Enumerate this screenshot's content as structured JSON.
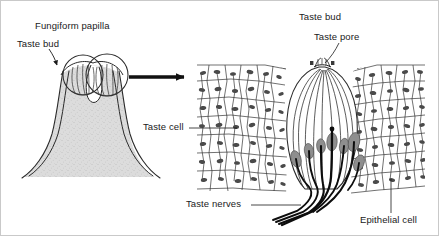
{
  "figure": {
    "title_alt": "Fungiform papilla and taste bud structure",
    "background_color": "#ffffff",
    "border_color": "#c9c9c9",
    "ink_color": "#1a1a1a",
    "nucleus_fill": "#8e8e8e",
    "papilla_fill": "#d8d8d8",
    "width": 439,
    "height": 236
  },
  "labels": {
    "fungiform_papilla": "Fungiform papilla",
    "taste_bud_left": "Taste bud",
    "taste_bud_right": "Taste bud",
    "taste_pore": "Taste pore",
    "taste_cell": "Taste cell",
    "taste_nerves": "Taste nerves",
    "epithelial_cell": "Epithelial cell"
  },
  "panels": {
    "left": {
      "name": "fungiform-papilla-panel",
      "description": "Mushroom-shaped fungiform papilla with two taste buds on its upper surface, stippled gray interior."
    },
    "right": {
      "name": "taste-bud-detail-panel",
      "description": "Magnified taste bud embedded in stratified epithelium, showing taste pore, elongated taste cells with nuclei, and taste nerve fibers exiting at the base."
    }
  },
  "connector": {
    "name": "magnification-arrow",
    "description": "Thick black arrow pointing right from the papilla to the magnified taste bud"
  }
}
